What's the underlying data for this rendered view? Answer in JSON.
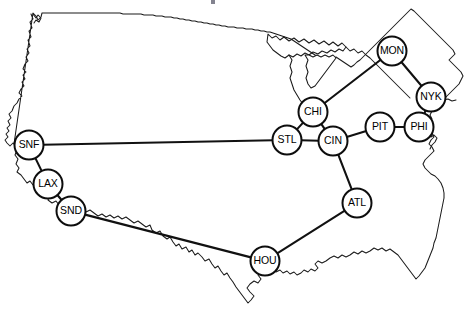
{
  "diagram": {
    "type": "network-graph-on-map",
    "background_color": "#ffffff",
    "node_fill_color": "#ffffff",
    "node_stroke_color": "#0d0d0d",
    "edge_color": "#111111",
    "map_outline_color": "#1a1a1a",
    "node_radius": 14.5,
    "canvas": {
      "width": 469,
      "height": 327
    }
  },
  "nodes": [
    {
      "id": "SNF",
      "label": "SNF",
      "x": 29,
      "y": 145
    },
    {
      "id": "LAX",
      "label": "LAX",
      "x": 48,
      "y": 184
    },
    {
      "id": "SND",
      "label": "SND",
      "x": 71,
      "y": 211
    },
    {
      "id": "HOU",
      "label": "HOU",
      "x": 265,
      "y": 261
    },
    {
      "id": "ATL",
      "label": "ATL",
      "x": 357,
      "y": 203
    },
    {
      "id": "STL",
      "label": "STL",
      "x": 287,
      "y": 140
    },
    {
      "id": "CHI",
      "label": "CHI",
      "x": 313,
      "y": 112
    },
    {
      "id": "CIN",
      "label": "CIN",
      "x": 333,
      "y": 141
    },
    {
      "id": "PIT",
      "label": "PIT",
      "x": 380,
      "y": 127
    },
    {
      "id": "PHI",
      "label": "PHI",
      "x": 419,
      "y": 127
    },
    {
      "id": "NYK",
      "label": "NYK",
      "x": 431,
      "y": 97
    },
    {
      "id": "MON",
      "label": "MON",
      "x": 392,
      "y": 51
    }
  ],
  "edges": [
    {
      "from": "SNF",
      "to": "STL"
    },
    {
      "from": "SNF",
      "to": "LAX"
    },
    {
      "from": "LAX",
      "to": "SND"
    },
    {
      "from": "SND",
      "to": "HOU"
    },
    {
      "from": "HOU",
      "to": "ATL"
    },
    {
      "from": "ATL",
      "to": "CIN"
    },
    {
      "from": "STL",
      "to": "CHI"
    },
    {
      "from": "STL",
      "to": "CIN"
    },
    {
      "from": "CHI",
      "to": "CIN"
    },
    {
      "from": "CHI",
      "to": "MON"
    },
    {
      "from": "CIN",
      "to": "PIT"
    },
    {
      "from": "PIT",
      "to": "PHI"
    },
    {
      "from": "PHI",
      "to": "NYK"
    },
    {
      "from": "NYK",
      "to": "MON"
    }
  ]
}
